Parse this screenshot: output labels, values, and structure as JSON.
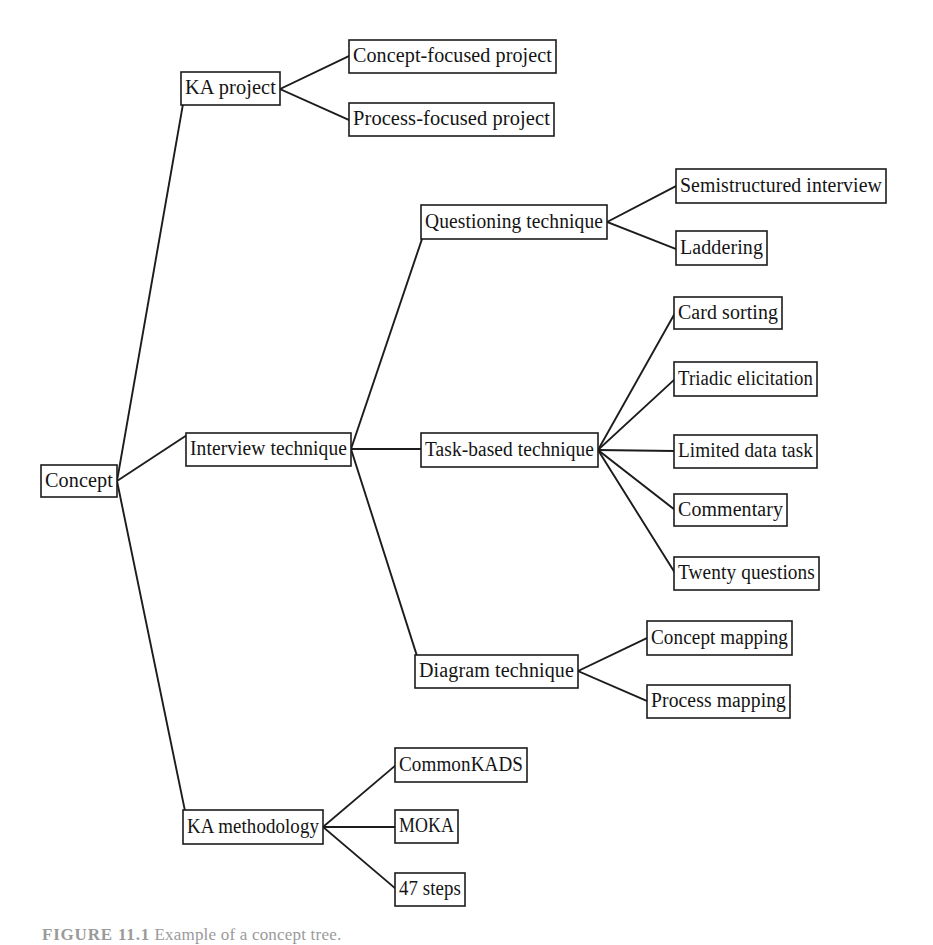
{
  "figure": {
    "caption_label": "FIGURE 11.1",
    "caption_text": "Example of a concept tree."
  },
  "diagram": {
    "type": "tree",
    "orientation": "left-to-right",
    "root": "Concept",
    "nodes": [
      {
        "id": "concept",
        "label": "Concept",
        "level": 0,
        "x": 41,
        "y": 465,
        "w": 76,
        "h": 32
      },
      {
        "id": "ka-project",
        "label": "KA project",
        "level": 1,
        "x": 181,
        "y": 72,
        "w": 99,
        "h": 33
      },
      {
        "id": "concept-focused",
        "label": "Concept-focused project",
        "level": 2,
        "x": 349,
        "y": 40,
        "w": 207,
        "h": 33
      },
      {
        "id": "process-focused",
        "label": "Process-focused project",
        "level": 2,
        "x": 349,
        "y": 103,
        "w": 205,
        "h": 33
      },
      {
        "id": "interview-technique",
        "label": "Interview technique",
        "level": 1,
        "x": 186,
        "y": 433,
        "w": 165,
        "h": 33
      },
      {
        "id": "questioning",
        "label": "Questioning technique",
        "level": 2,
        "x": 421,
        "y": 205,
        "w": 186,
        "h": 34
      },
      {
        "id": "semistructured",
        "label": "Semistructured interview",
        "level": 3,
        "x": 676,
        "y": 169,
        "w": 210,
        "h": 34
      },
      {
        "id": "laddering",
        "label": "Laddering",
        "level": 3,
        "x": 676,
        "y": 231,
        "w": 91,
        "h": 34
      },
      {
        "id": "task-based",
        "label": "Task-based technique",
        "level": 2,
        "x": 421,
        "y": 433,
        "w": 177,
        "h": 34
      },
      {
        "id": "card-sorting",
        "label": "Card sorting",
        "level": 3,
        "x": 674,
        "y": 297,
        "w": 108,
        "h": 32
      },
      {
        "id": "triadic",
        "label": "Triadic elicitation",
        "level": 3,
        "x": 674,
        "y": 362,
        "w": 143,
        "h": 34
      },
      {
        "id": "limited-data",
        "label": "Limited data task",
        "level": 3,
        "x": 674,
        "y": 435,
        "w": 143,
        "h": 33
      },
      {
        "id": "commentary",
        "label": "Commentary",
        "level": 3,
        "x": 674,
        "y": 494,
        "w": 113,
        "h": 32
      },
      {
        "id": "twenty-questions",
        "label": "Twenty questions",
        "level": 3,
        "x": 674,
        "y": 557,
        "w": 145,
        "h": 33
      },
      {
        "id": "diagram-technique",
        "label": "Diagram technique",
        "level": 2,
        "x": 415,
        "y": 655,
        "w": 163,
        "h": 33
      },
      {
        "id": "concept-mapping",
        "label": "Concept mapping",
        "level": 3,
        "x": 647,
        "y": 621,
        "w": 145,
        "h": 34
      },
      {
        "id": "process-mapping",
        "label": "Process mapping",
        "level": 3,
        "x": 647,
        "y": 685,
        "w": 143,
        "h": 33
      },
      {
        "id": "ka-methodology",
        "label": "KA methodology",
        "level": 1,
        "x": 183,
        "y": 810,
        "w": 140,
        "h": 34
      },
      {
        "id": "commonkads",
        "label": "CommonKADS",
        "level": 2,
        "x": 395,
        "y": 748,
        "w": 132,
        "h": 34
      },
      {
        "id": "moka",
        "label": "MOKA",
        "level": 2,
        "x": 395,
        "y": 810,
        "w": 63,
        "h": 33
      },
      {
        "id": "steps47",
        "label": "47 steps",
        "level": 2,
        "x": 395,
        "y": 873,
        "w": 70,
        "h": 33
      }
    ],
    "edges": [
      {
        "from": "concept",
        "to": "ka-project",
        "x1": 117,
        "y1": 481,
        "x2": 183,
        "y2": 104
      },
      {
        "from": "concept",
        "to": "interview-technique",
        "x1": 117,
        "y1": 481,
        "x2": 187,
        "y2": 435
      },
      {
        "from": "concept",
        "to": "ka-methodology",
        "x1": 117,
        "y1": 481,
        "x2": 185,
        "y2": 811
      },
      {
        "from": "ka-project",
        "to": "concept-focused",
        "x1": 280,
        "y1": 89,
        "x2": 349,
        "y2": 56
      },
      {
        "from": "ka-project",
        "to": "process-focused",
        "x1": 280,
        "y1": 89,
        "x2": 349,
        "y2": 120
      },
      {
        "from": "interview-technique",
        "to": "questioning",
        "x1": 351,
        "y1": 449,
        "x2": 422,
        "y2": 239
      },
      {
        "from": "interview-technique",
        "to": "task-based",
        "x1": 351,
        "y1": 449,
        "x2": 421,
        "y2": 449
      },
      {
        "from": "interview-technique",
        "to": "diagram-technique",
        "x1": 351,
        "y1": 449,
        "x2": 417,
        "y2": 656
      },
      {
        "from": "questioning",
        "to": "semistructured",
        "x1": 607,
        "y1": 222,
        "x2": 676,
        "y2": 186
      },
      {
        "from": "questioning",
        "to": "laddering",
        "x1": 607,
        "y1": 222,
        "x2": 676,
        "y2": 249
      },
      {
        "from": "task-based",
        "to": "card-sorting",
        "x1": 598,
        "y1": 450,
        "x2": 675,
        "y2": 313
      },
      {
        "from": "task-based",
        "to": "triadic",
        "x1": 598,
        "y1": 450,
        "x2": 675,
        "y2": 379
      },
      {
        "from": "task-based",
        "to": "limited-data",
        "x1": 598,
        "y1": 450,
        "x2": 674,
        "y2": 451
      },
      {
        "from": "task-based",
        "to": "commentary",
        "x1": 598,
        "y1": 450,
        "x2": 675,
        "y2": 510
      },
      {
        "from": "task-based",
        "to": "twenty-questions",
        "x1": 598,
        "y1": 450,
        "x2": 675,
        "y2": 573
      },
      {
        "from": "diagram-technique",
        "to": "concept-mapping",
        "x1": 578,
        "y1": 671,
        "x2": 647,
        "y2": 638
      },
      {
        "from": "diagram-technique",
        "to": "process-mapping",
        "x1": 578,
        "y1": 671,
        "x2": 647,
        "y2": 701
      },
      {
        "from": "ka-methodology",
        "to": "commonkads",
        "x1": 323,
        "y1": 827,
        "x2": 396,
        "y2": 765
      },
      {
        "from": "ka-methodology",
        "to": "moka",
        "x1": 323,
        "y1": 827,
        "x2": 395,
        "y2": 827
      },
      {
        "from": "ka-methodology",
        "to": "steps47",
        "x1": 323,
        "y1": 827,
        "x2": 396,
        "y2": 889
      }
    ]
  }
}
